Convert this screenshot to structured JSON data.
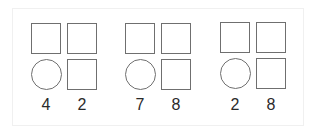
{
  "groups": [
    {
      "left_number": "4",
      "right_number": "2",
      "shapes": [
        "square",
        "square",
        "circle",
        "square"
      ]
    },
    {
      "left_number": "7",
      "right_number": "8",
      "shapes": [
        "square",
        "square",
        "circle",
        "square"
      ]
    },
    {
      "left_number": "2",
      "right_number": "8",
      "shapes": [
        "square",
        "square",
        "circle",
        "square"
      ]
    }
  ],
  "colors": {
    "stroke": "#6f6f6f",
    "text": "#2a2a2a",
    "background": "#ffffff"
  }
}
